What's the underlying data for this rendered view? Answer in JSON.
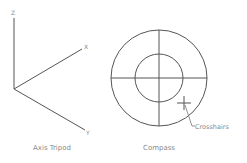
{
  "diagram": {
    "colors": {
      "stroke": "#555555",
      "text": "#8a8a8a",
      "background": "#ffffff"
    },
    "axis_tripod": {
      "caption": "Axis Tripod",
      "axes": [
        {
          "name": "z",
          "label": "Z"
        },
        {
          "name": "x",
          "label": "X"
        },
        {
          "name": "y",
          "label": "Y"
        }
      ]
    },
    "compass": {
      "caption": "Compass",
      "rings": [
        "outer",
        "inner"
      ],
      "crosshairs_label": "Crosshairs"
    }
  }
}
